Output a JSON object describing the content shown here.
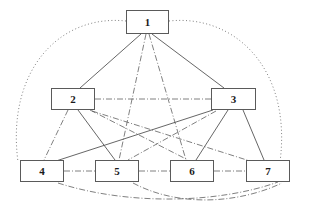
{
  "diagram": {
    "width": 301,
    "height": 212,
    "background_color": "#ffffff",
    "node_border_color": "#5a5a5a",
    "node_fill_color": "#ffffff",
    "edge_color": "#555555",
    "nodes": [
      {
        "id": "1",
        "label": "1",
        "x": 126,
        "y": 10,
        "w": 43,
        "h": 24,
        "cx": 147.5,
        "cy": 22
      },
      {
        "id": "2",
        "label": "2",
        "x": 51,
        "y": 88,
        "w": 44,
        "h": 22,
        "cx": 73,
        "cy": 99
      },
      {
        "id": "3",
        "label": "3",
        "x": 211,
        "y": 88,
        "w": 45,
        "h": 22,
        "cx": 233.5,
        "cy": 99
      },
      {
        "id": "4",
        "label": "4",
        "x": 20,
        "y": 160,
        "w": 44,
        "h": 22,
        "cx": 42,
        "cy": 171
      },
      {
        "id": "5",
        "label": "5",
        "x": 95,
        "y": 160,
        "w": 44,
        "h": 22,
        "cx": 117,
        "cy": 171
      },
      {
        "id": "6",
        "label": "6",
        "x": 170,
        "y": 160,
        "w": 44,
        "h": 22,
        "cx": 192,
        "cy": 171
      },
      {
        "id": "7",
        "label": "7",
        "x": 246,
        "y": 160,
        "w": 44,
        "h": 22,
        "cx": 268,
        "cy": 171
      }
    ],
    "edges": [
      {
        "from": "1",
        "to": "2",
        "style": "solid",
        "path": "M 141 34 L 80 88"
      },
      {
        "from": "1",
        "to": "3",
        "style": "solid",
        "path": "M 152 34 L 224 88"
      },
      {
        "from": "1",
        "to": "5",
        "style": "dashdot",
        "path": "M 146 34 L 119 160"
      },
      {
        "from": "1",
        "to": "6",
        "style": "dashdot",
        "path": "M 149 34 L 186 160"
      },
      {
        "from": "1",
        "to": "4",
        "style": "dotted",
        "path": "M 126 21 C 60 14 6 70 18 162"
      },
      {
        "from": "1",
        "to": "7",
        "style": "dotted",
        "path": "M 169 21 C 236 14 292 70 280 162"
      },
      {
        "from": "2",
        "to": "3",
        "style": "dashdot",
        "path": "M 95 99 L 211 99"
      },
      {
        "from": "2",
        "to": "4",
        "style": "dashdot",
        "path": "M 68 110 L 44 160"
      },
      {
        "from": "2",
        "to": "5",
        "style": "solid",
        "path": "M 78 110 L 115 160"
      },
      {
        "from": "2",
        "to": "6",
        "style": "dashdot",
        "path": "M 90 110 L 188 160"
      },
      {
        "from": "2",
        "to": "7",
        "style": "dashdot",
        "path": "M 92 111 L 250 161"
      },
      {
        "from": "3",
        "to": "4",
        "style": "solid",
        "path": "M 213 110 L 56 161"
      },
      {
        "from": "3",
        "to": "5",
        "style": "dashdot",
        "path": "M 216 111 L 128 160"
      },
      {
        "from": "3",
        "to": "6",
        "style": "solid",
        "path": "M 228 110 L 196 160"
      },
      {
        "from": "3",
        "to": "7",
        "style": "solid",
        "path": "M 243 110 L 264 160"
      },
      {
        "from": "4",
        "to": "5",
        "style": "dashdot",
        "path": "M 64 171 L 95 171"
      },
      {
        "from": "5",
        "to": "6",
        "style": "dashdot",
        "path": "M 139 171 L 170 171"
      },
      {
        "from": "6",
        "to": "7",
        "style": "dashdot",
        "path": "M 214 171 L 246 171"
      },
      {
        "from": "4",
        "to": "7",
        "style": "dashdot",
        "path": "M 58 183 C 130 206 220 203 278 182"
      },
      {
        "from": "5",
        "to": "7",
        "style": "dashdot",
        "path": "M 133 183 C 180 208 240 203 282 183"
      }
    ]
  }
}
